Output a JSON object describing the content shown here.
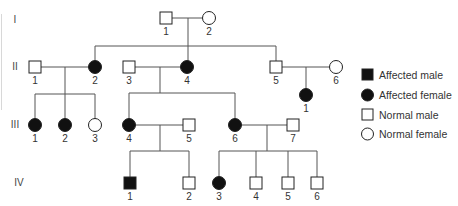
{
  "generations": [
    "I",
    "II",
    "III",
    "IV"
  ],
  "individuals": {
    "I-1": {
      "label": "1",
      "sex": "male",
      "affected": false
    },
    "I-2": {
      "label": "2",
      "sex": "female",
      "affected": false
    },
    "II-1": {
      "label": "1",
      "sex": "male",
      "affected": false
    },
    "II-2": {
      "label": "2",
      "sex": "female",
      "affected": true
    },
    "II-3": {
      "label": "3",
      "sex": "male",
      "affected": false
    },
    "II-4": {
      "label": "4",
      "sex": "female",
      "affected": true
    },
    "II-5": {
      "label": "5",
      "sex": "male",
      "affected": false
    },
    "II-6": {
      "label": "6",
      "sex": "female",
      "affected": false
    },
    "III-1a": {
      "label": "1",
      "sex": "female",
      "affected": true
    },
    "III-2": {
      "label": "2",
      "sex": "female",
      "affected": true
    },
    "III-3": {
      "label": "3",
      "sex": "female",
      "affected": false
    },
    "III-4": {
      "label": "4",
      "sex": "female",
      "affected": true
    },
    "III-5": {
      "label": "5",
      "sex": "male",
      "affected": false
    },
    "III-6": {
      "label": "6",
      "sex": "female",
      "affected": true
    },
    "III-7": {
      "label": "7",
      "sex": "male",
      "affected": false
    },
    "III-1b": {
      "label": "1",
      "sex": "female",
      "affected": true
    },
    "IV-1": {
      "label": "1",
      "sex": "male",
      "affected": true
    },
    "IV-2": {
      "label": "2",
      "sex": "male",
      "affected": false
    },
    "IV-3": {
      "label": "3",
      "sex": "female",
      "affected": true
    },
    "IV-4": {
      "label": "4",
      "sex": "male",
      "affected": false
    },
    "IV-5": {
      "label": "5",
      "sex": "male",
      "affected": false
    },
    "IV-6": {
      "label": "6",
      "sex": "male",
      "affected": false
    }
  },
  "legend": [
    {
      "symbol": "filled-square",
      "label": "Affected male"
    },
    {
      "symbol": "filled-circle",
      "label": "Affected female"
    },
    {
      "symbol": "open-square",
      "label": "Normal male"
    },
    {
      "symbol": "open-circle",
      "label": "Normal female"
    }
  ],
  "colors": {
    "affected": "#111111",
    "line": "#555555",
    "symbol_stroke": "#222222"
  }
}
